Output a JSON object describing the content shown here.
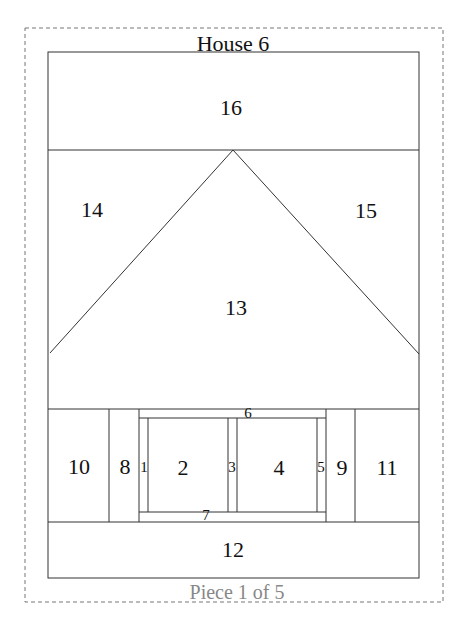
{
  "diagram": {
    "title": "House 6",
    "footer": "Piece 1 of 5",
    "colors": {
      "line": "#333333",
      "dashed": "#777777",
      "footer_text": "#888888",
      "text": "#111111"
    },
    "pieces": [
      {
        "id": "1",
        "label": "1",
        "x": 144,
        "y": 467,
        "size": "small"
      },
      {
        "id": "2",
        "label": "2",
        "x": 183,
        "y": 468,
        "size": "big"
      },
      {
        "id": "3",
        "label": "3",
        "x": 232,
        "y": 467,
        "size": "small"
      },
      {
        "id": "4",
        "label": "4",
        "x": 279,
        "y": 468,
        "size": "big"
      },
      {
        "id": "5",
        "label": "5",
        "x": 321,
        "y": 467,
        "size": "small"
      },
      {
        "id": "6",
        "label": "6",
        "x": 248,
        "y": 413,
        "size": "small"
      },
      {
        "id": "7",
        "label": "7",
        "x": 206,
        "y": 515,
        "size": "small"
      },
      {
        "id": "8",
        "label": "8",
        "x": 125,
        "y": 467,
        "size": "big"
      },
      {
        "id": "9",
        "label": "9",
        "x": 342,
        "y": 468,
        "size": "big"
      },
      {
        "id": "10",
        "label": "10",
        "x": 79,
        "y": 467,
        "size": "big"
      },
      {
        "id": "11",
        "label": "11",
        "x": 387,
        "y": 468,
        "size": "big"
      },
      {
        "id": "12",
        "label": "12",
        "x": 233,
        "y": 550,
        "size": "big"
      },
      {
        "id": "13",
        "label": "13",
        "x": 236,
        "y": 308,
        "size": "big"
      },
      {
        "id": "14",
        "label": "14",
        "x": 92,
        "y": 210,
        "size": "big"
      },
      {
        "id": "15",
        "label": "15",
        "x": 366,
        "y": 211,
        "size": "big"
      },
      {
        "id": "16",
        "label": "16",
        "x": 231,
        "y": 108,
        "size": "big"
      }
    ]
  }
}
